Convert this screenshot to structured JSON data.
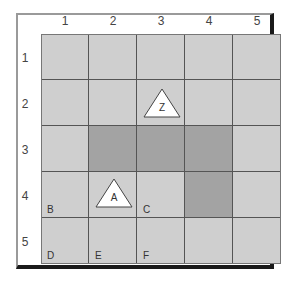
{
  "columns": [
    "1",
    "2",
    "3",
    "4",
    "5"
  ],
  "rows": [
    "1",
    "2",
    "3",
    "4",
    "5"
  ],
  "dark_cells": [
    [
      3,
      2
    ],
    [
      3,
      3
    ],
    [
      3,
      4
    ],
    [
      4,
      4
    ]
  ],
  "corner_labels": {
    "B": "B",
    "C": "C",
    "D": "D",
    "E": "E",
    "F": "F"
  },
  "markers": {
    "Z": "Z",
    "A": "A"
  },
  "colors": {
    "cell": "#cfcfcf",
    "dark_cell": "#a3a3a3",
    "grid_line": "#555555",
    "marker_fill": "#ffffff"
  }
}
